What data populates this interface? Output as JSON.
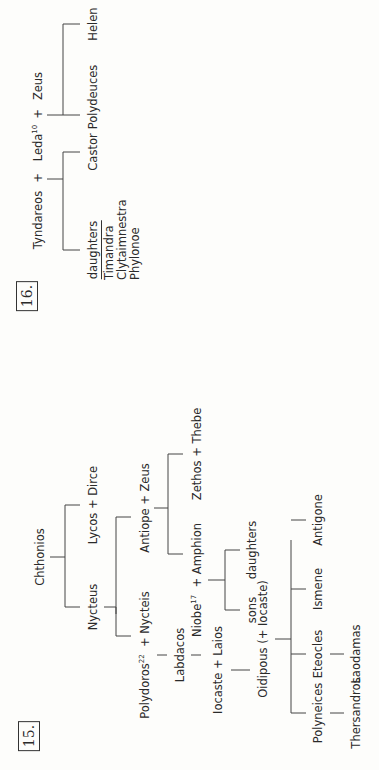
{
  "figures": [
    {
      "number": "15.",
      "title": "Theban royal family",
      "nodes": {
        "chthonios": "Chthonios",
        "nycteus": "Nycteus",
        "lycos_dirce": "Lycos + Dirce",
        "polydoros": "Polydoros",
        "polydoros_note": "22",
        "plus_nycteis": "+ Nycteis",
        "antiope_zeus": "Antiope + Zeus",
        "labdacos": "Labdacos",
        "niobe": "Niobe",
        "niobe_note": "17",
        "plus_amphion": "+ Amphion",
        "zethos_thebe": "Zethos + Thebe",
        "iocaste_laios": "Iocaste + Laios",
        "sons": "sons",
        "daughters": "daughters",
        "oidipous": "Oidipous (+ Iocaste)",
        "polyneices": "Polyneices",
        "eteocles": "Eteocles",
        "ismene": "Ismene",
        "antigone": "Antigone",
        "thersandros": "Thersandros",
        "laodamas": "Laodamas"
      }
    },
    {
      "number": "16.",
      "nodes": {
        "tyndareos": "Tyndareos",
        "plus1": "+",
        "leda": "Leda",
        "leda_note": "10",
        "plus2": "+",
        "zeus": "Zeus",
        "daughters": "daughters",
        "daughters_list": [
          "Timandra",
          "Clytaimnestra",
          "Phylonoe"
        ],
        "castor": "Castor",
        "polydeuces": "Polydeuces",
        "helen": "Helen"
      }
    }
  ],
  "orientation": "rotated 90 degrees counter-clockwise"
}
